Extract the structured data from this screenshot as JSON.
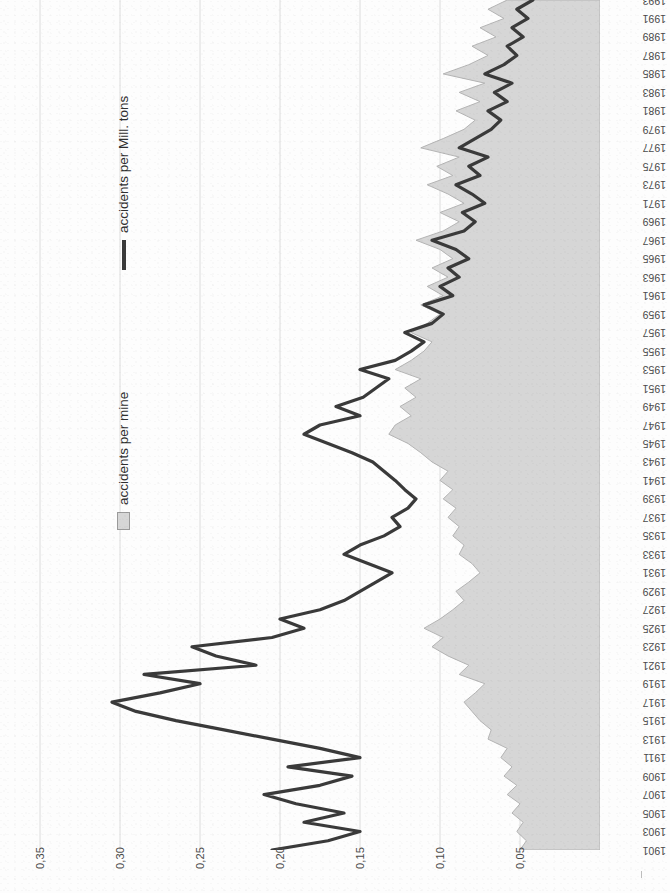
{
  "legend": {
    "line_label": "accidents per Mill. tons",
    "area_label": "accidents per mine",
    "line_color": "#3a3a3a",
    "area_color": "#d6d6d6"
  },
  "axes": {
    "value_ticks": [
      "0,35",
      "0,30",
      "0,25",
      "0,20",
      "0,15",
      "0,10",
      "0,05"
    ],
    "value_reversed": true,
    "year_first": "1901",
    "year_last": "1993",
    "year_step": 2
  },
  "chart_data": {
    "type": "area",
    "title": "",
    "subtitle": "",
    "xlabel": "",
    "ylabel": "",
    "orientation": "horizontal-rotated",
    "grid": true,
    "legend_position": "left-inside",
    "xlim": [
      0,
      0.375
    ],
    "x_reversed": true,
    "xticks": [
      0.35,
      0.3,
      0.25,
      0.2,
      0.15,
      0.1,
      0.05
    ],
    "xtick_labels": [
      "0,35",
      "0,30",
      "0,25",
      "0,20",
      "0,15",
      "0,10",
      "0,05"
    ],
    "categories": [
      1901,
      1902,
      1903,
      1904,
      1905,
      1906,
      1907,
      1908,
      1909,
      1910,
      1911,
      1912,
      1913,
      1914,
      1915,
      1916,
      1917,
      1918,
      1919,
      1920,
      1921,
      1922,
      1923,
      1924,
      1925,
      1926,
      1927,
      1928,
      1929,
      1930,
      1931,
      1932,
      1933,
      1934,
      1935,
      1936,
      1937,
      1938,
      1939,
      1940,
      1941,
      1942,
      1943,
      1944,
      1945,
      1946,
      1947,
      1948,
      1949,
      1950,
      1951,
      1952,
      1953,
      1954,
      1955,
      1956,
      1957,
      1958,
      1959,
      1960,
      1961,
      1962,
      1963,
      1964,
      1965,
      1966,
      1967,
      1968,
      1969,
      1970,
      1971,
      1972,
      1973,
      1974,
      1975,
      1976,
      1977,
      1978,
      1979,
      1980,
      1981,
      1982,
      1983,
      1984,
      1985,
      1986,
      1987,
      1988,
      1989,
      1990,
      1991,
      1992,
      1993
    ],
    "series": [
      {
        "name": "accidents per Mill. tons",
        "render": "line",
        "color": "#3a3a3a",
        "values": [
          0.205,
          0.17,
          0.15,
          0.185,
          0.16,
          0.19,
          0.21,
          0.175,
          0.155,
          0.195,
          0.15,
          0.175,
          0.205,
          0.235,
          0.265,
          0.29,
          0.305,
          0.275,
          0.25,
          0.285,
          0.215,
          0.24,
          0.255,
          0.205,
          0.185,
          0.2,
          0.175,
          0.16,
          0.15,
          0.14,
          0.13,
          0.145,
          0.16,
          0.15,
          0.135,
          0.125,
          0.13,
          0.12,
          0.115,
          0.122,
          0.128,
          0.135,
          0.142,
          0.155,
          0.17,
          0.185,
          0.175,
          0.15,
          0.165,
          0.148,
          0.14,
          0.132,
          0.15,
          0.128,
          0.118,
          0.11,
          0.122,
          0.105,
          0.098,
          0.11,
          0.092,
          0.1,
          0.088,
          0.095,
          0.082,
          0.09,
          0.105,
          0.085,
          0.078,
          0.086,
          0.072,
          0.08,
          0.09,
          0.075,
          0.082,
          0.07,
          0.088,
          0.078,
          0.068,
          0.062,
          0.07,
          0.058,
          0.066,
          0.055,
          0.072,
          0.06,
          0.052,
          0.058,
          0.048,
          0.055,
          0.045,
          0.052,
          0.042
        ]
      },
      {
        "name": "accidents per mine",
        "render": "area",
        "color": "#d6d6d6",
        "values": [
          0.05,
          0.046,
          0.052,
          0.048,
          0.055,
          0.05,
          0.058,
          0.052,
          0.06,
          0.055,
          0.062,
          0.058,
          0.07,
          0.068,
          0.075,
          0.08,
          0.085,
          0.078,
          0.072,
          0.088,
          0.082,
          0.095,
          0.105,
          0.098,
          0.11,
          0.1,
          0.092,
          0.085,
          0.09,
          0.082,
          0.075,
          0.08,
          0.088,
          0.085,
          0.092,
          0.088,
          0.095,
          0.09,
          0.098,
          0.092,
          0.1,
          0.095,
          0.105,
          0.112,
          0.12,
          0.132,
          0.128,
          0.118,
          0.125,
          0.115,
          0.122,
          0.112,
          0.128,
          0.118,
          0.11,
          0.105,
          0.118,
          0.108,
          0.1,
          0.112,
          0.098,
          0.108,
          0.095,
          0.105,
          0.092,
          0.1,
          0.115,
          0.098,
          0.088,
          0.1,
          0.085,
          0.095,
          0.108,
          0.092,
          0.102,
          0.088,
          0.112,
          0.098,
          0.085,
          0.078,
          0.09,
          0.075,
          0.088,
          0.072,
          0.098,
          0.082,
          0.07,
          0.08,
          0.065,
          0.075,
          0.06,
          0.07,
          0.058
        ]
      }
    ]
  }
}
